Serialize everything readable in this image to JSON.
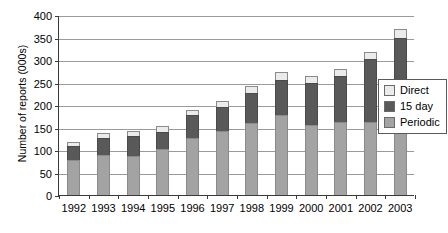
{
  "chart_data": {
    "type": "bar",
    "subtype": "stacked-vertical",
    "title": "",
    "xlabel": "",
    "ylabel": "Number of reports (000s)",
    "ylim": [
      0,
      400
    ],
    "ytick_step": 50,
    "yticks": [
      "400",
      "350",
      "300",
      "250",
      "200",
      "150",
      "100",
      "50",
      "0"
    ],
    "grid": true,
    "legend_position": "right",
    "categories": [
      "1992",
      "1993",
      "1994",
      "1995",
      "1996",
      "1997",
      "1998",
      "1999",
      "2000",
      "2001",
      "2002",
      "2003"
    ],
    "series": [
      {
        "name": "Direct",
        "color": "#ebebeb",
        "values": [
          9,
          12,
          12,
          13,
          13,
          14,
          15,
          18,
          15,
          15,
          15,
          20
        ]
      },
      {
        "name": "15 day",
        "color": "#595959",
        "values": [
          32,
          36,
          45,
          39,
          50,
          53,
          67,
          78,
          94,
          103,
          140,
          148
        ]
      },
      {
        "name": "Periodic",
        "color": "#a3a3a3",
        "values": [
          77,
          90,
          86,
          102,
          127,
          143,
          160,
          178,
          155,
          162,
          163,
          200
        ]
      }
    ],
    "totals": [
      118,
      138,
      143,
      154,
      190,
      210,
      242,
      274,
      264,
      280,
      318,
      368
    ]
  },
  "legend": {
    "items": [
      {
        "label": "Direct",
        "color": "#ebebeb"
      },
      {
        "label": "15 day",
        "color": "#595959"
      },
      {
        "label": "Periodic",
        "color": "#a3a3a3"
      }
    ]
  }
}
